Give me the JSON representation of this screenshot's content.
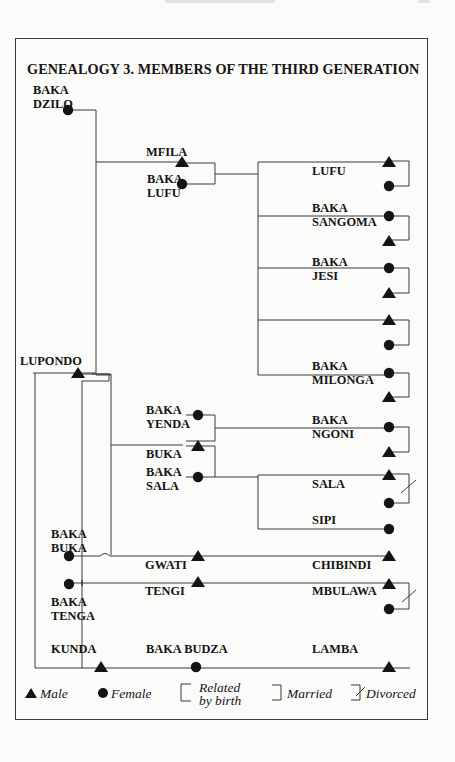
{
  "figure": {
    "title": "GENEALOGY 3. MEMBERS OF THE THIRD GENERATION"
  },
  "people": {
    "baka_dzilo": {
      "name": "BAKA\nDZILO",
      "line1": "BAKA",
      "line2": "DZILO",
      "sex": "female"
    },
    "mfila": {
      "name": "MFILA",
      "sex": "male"
    },
    "baka_lufu": {
      "line1": "BAKA",
      "line2": "LUFU",
      "sex": "female"
    },
    "lufu": {
      "name": "LUFU",
      "sex": "male"
    },
    "baka_sangoma": {
      "line1": "BAKA",
      "line2": "SANGOMA",
      "sex": "female"
    },
    "baka_jesi": {
      "line1": "BAKA",
      "line2": "JESI",
      "sex": "female"
    },
    "unnamed_male": {
      "name": "",
      "sex": "male"
    },
    "baka_milonga": {
      "line1": "BAKA",
      "line2": "MILONGA",
      "sex": "female"
    },
    "lupondo": {
      "name": "LUPONDO",
      "sex": "male"
    },
    "baka_yenda": {
      "line1": "BAKA",
      "line2": "YENDA",
      "sex": "female"
    },
    "buka": {
      "name": "BUKA",
      "sex": "male"
    },
    "baka_sala": {
      "line1": "BAKA",
      "line2": "SALA",
      "sex": "female"
    },
    "baka_ngoni": {
      "line1": "BAKA",
      "line2": "NGONI",
      "sex": "female"
    },
    "sala": {
      "name": "SALA",
      "sex": "male"
    },
    "sipi": {
      "name": "SIPI",
      "sex": "female"
    },
    "baka_buka": {
      "line1": "BAKA",
      "line2": "BUKA",
      "sex": "female"
    },
    "gwati": {
      "name": "GWATI",
      "sex": "male"
    },
    "chibindi": {
      "name": "CHIBINDI",
      "sex": "male"
    },
    "tengi": {
      "name": "TENGI",
      "sex": "male"
    },
    "mbulawa": {
      "name": "MBULAWA",
      "sex": "male"
    },
    "baka_tenga": {
      "line1": "BAKA",
      "line2": "TENGA",
      "sex": "female"
    },
    "kunda": {
      "name": "KUNDA",
      "sex": "male"
    },
    "baka_budza": {
      "name": "BAKA BUDZA",
      "sex": "female"
    },
    "lamba": {
      "name": "LAMBA",
      "sex": "male"
    }
  },
  "legend": {
    "male": "Male",
    "female": "Female",
    "related_line1": "Related",
    "related_line2": "by  birth",
    "married": "Married",
    "divorced": "Divorced"
  },
  "colors": {
    "ink": "#141414",
    "line": "#3a3a3a",
    "paper": "#fbfbf9"
  }
}
